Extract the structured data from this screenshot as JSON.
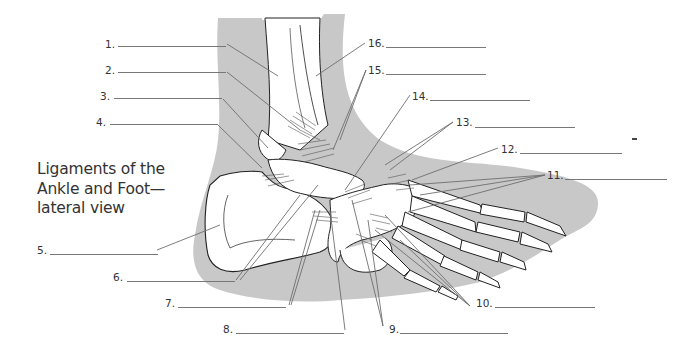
{
  "diagram": {
    "title_lines": [
      "Ligaments of the",
      "Ankle and Foot—",
      "lateral view"
    ],
    "colors": {
      "background": "#ffffff",
      "silhouette": "#c8c8c8",
      "bone_fill": "#ffffff",
      "outline": "#222222",
      "leader_line": "#6e6e6e",
      "text": "#333333"
    },
    "labels": [
      {
        "number": "1.",
        "blank": ""
      },
      {
        "number": "2.",
        "blank": ""
      },
      {
        "number": "3.",
        "blank": ""
      },
      {
        "number": "4.",
        "blank": ""
      },
      {
        "number": "5.",
        "blank": ""
      },
      {
        "number": "6.",
        "blank": ""
      },
      {
        "number": "7.",
        "blank": ""
      },
      {
        "number": "8.",
        "blank": ""
      },
      {
        "number": "9.",
        "blank": ""
      },
      {
        "number": "10.",
        "blank": ""
      },
      {
        "number": "11.",
        "blank": ""
      },
      {
        "number": "12.",
        "blank": ""
      },
      {
        "number": "13.",
        "blank": ""
      },
      {
        "number": "14.",
        "blank": ""
      },
      {
        "number": "15.",
        "blank": ""
      },
      {
        "number": "16.",
        "blank": ""
      }
    ]
  }
}
